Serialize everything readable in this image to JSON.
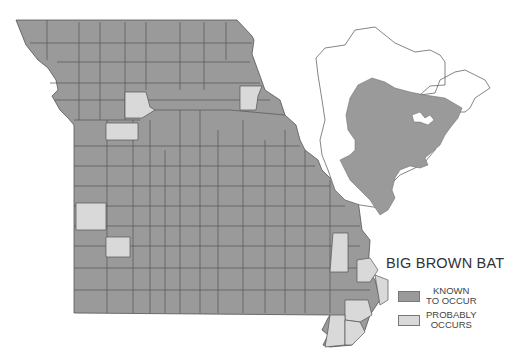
{
  "title": "BIG BROWN BAT",
  "legend": [
    {
      "label_line1": "KNOWN",
      "label_line2": "TO OCCUR",
      "color": "#9a9a9a"
    },
    {
      "label_line1": "PROBABLY",
      "label_line2": "OCCURS",
      "color": "#d9d9d9"
    }
  ],
  "colors": {
    "known": "#9a9a9a",
    "probable": "#d9d9d9",
    "border": "#555555",
    "background": "#ffffff"
  },
  "maps": {
    "state": "Missouri counties",
    "inset": "North America range"
  }
}
